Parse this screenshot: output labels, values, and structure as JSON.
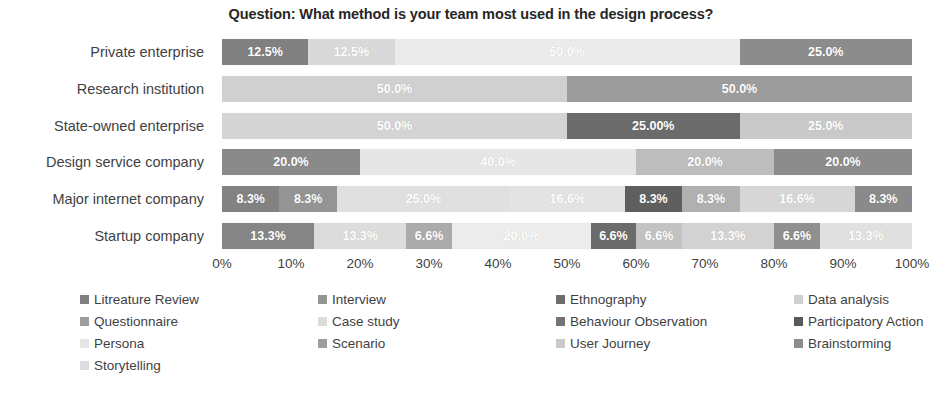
{
  "chart_data": {
    "type": "bar",
    "subtype": "horizontal-stacked-percent",
    "title": "Question: What method is your team most used in the design process?",
    "xlabel": "",
    "ylabel": "",
    "xlim": [
      0,
      100
    ],
    "grid": false,
    "legend_position": "bottom",
    "categories": [
      "Private enterprise",
      "Research institution",
      "State-owned enterprise",
      "Design service company",
      "Major internet company",
      "Startup company"
    ],
    "xticks": [
      "0%",
      "10%",
      "20%",
      "30%",
      "40%",
      "50%",
      "60%",
      "70%",
      "80%",
      "90%",
      "100%"
    ],
    "xtick_values": [
      0,
      10,
      20,
      30,
      40,
      50,
      60,
      70,
      80,
      90,
      100
    ],
    "series": [
      {
        "name": "Litreature Review",
        "color": "#808080",
        "values": [
          12.5,
          0,
          0,
          20.0,
          8.3,
          13.3
        ]
      },
      {
        "name": "Interview",
        "color": "#999999",
        "values": [
          0,
          0,
          0,
          0,
          8.3,
          0
        ]
      },
      {
        "name": "Ethnography",
        "color": "#6e6e6e",
        "values": [
          0,
          0,
          0,
          0,
          0,
          0
        ]
      },
      {
        "name": "Data analysis",
        "color": "#d9d9d9",
        "values": [
          12.5,
          0,
          0,
          0,
          0,
          13.3
        ]
      },
      {
        "name": "Questionnaire",
        "color": "#a6a6a6",
        "values": [
          0,
          50.0,
          0,
          0,
          0,
          6.6
        ]
      },
      {
        "name": "Case study",
        "color": "#e0e0e0",
        "values": [
          0,
          0,
          50.0,
          0,
          25.0,
          0
        ]
      },
      {
        "name": "Behaviour Observation",
        "color": "#737373",
        "values": [
          0,
          0,
          0,
          0,
          0,
          0
        ]
      },
      {
        "name": "Participatory Action",
        "color": "#595959",
        "values": [
          0,
          0,
          25.0,
          0,
          8.3,
          6.6
        ]
      },
      {
        "name": "Persona",
        "color": "#ebebeb",
        "values": [
          50.0,
          0,
          0,
          40.0,
          16.6,
          20.0
        ]
      },
      {
        "name": "Scenario",
        "color": "#9e9e9e",
        "values": [
          0,
          0,
          0,
          0,
          8.3,
          6.6
        ]
      },
      {
        "name": "User Journey",
        "color": "#c9c9c9",
        "values": [
          0,
          0,
          25.0,
          20.0,
          16.6,
          13.3
        ]
      },
      {
        "name": "Brainstorming",
        "color": "#8c8c8c",
        "values": [
          25.0,
          50.0,
          0,
          20.0,
          8.3,
          6.6
        ]
      },
      {
        "name": "Storytelling",
        "color": "#dedede",
        "values": [
          0,
          0,
          0,
          0,
          0,
          13.3
        ]
      }
    ],
    "bars": [
      {
        "category": "Private enterprise",
        "segments": [
          {
            "label": "12.5%",
            "value": 12.5,
            "series": "Litreature Review",
            "color": "#808080"
          },
          {
            "label": "12.5%",
            "value": 12.5,
            "series": "Data analysis",
            "color": "#d9d9d9"
          },
          {
            "label": "50.0%",
            "value": 50.0,
            "series": "Persona",
            "color": "#ebebeb"
          },
          {
            "label": "25.0%",
            "value": 25.0,
            "series": "Brainstorming",
            "color": "#8c8c8c"
          }
        ]
      },
      {
        "category": "Research institution",
        "segments": [
          {
            "label": "50.0%",
            "value": 50.0,
            "series": "Questionnaire",
            "color": "#d0d0d0"
          },
          {
            "label": "50.0%",
            "value": 50.0,
            "series": "Brainstorming",
            "color": "#9c9c9c"
          }
        ]
      },
      {
        "category": "State-owned enterprise",
        "segments": [
          {
            "label": "50.0%",
            "value": 50.0,
            "series": "Case study",
            "color": "#d4d4d4"
          },
          {
            "label": "25.00%",
            "value": 25.0,
            "series": "Participatory Action",
            "color": "#6b6b6b"
          },
          {
            "label": "25.0%",
            "value": 25.0,
            "series": "User Journey",
            "color": "#c9c9c9"
          }
        ]
      },
      {
        "category": "Design service company",
        "segments": [
          {
            "label": "20.0%",
            "value": 20.0,
            "series": "Litreature Review",
            "color": "#8a8a8a"
          },
          {
            "label": "40.0%",
            "value": 40.0,
            "series": "Persona",
            "color": "#e6e6e6"
          },
          {
            "label": "20.0%",
            "value": 20.0,
            "series": "User Journey",
            "color": "#bdbdbd"
          },
          {
            "label": "20.0%",
            "value": 20.0,
            "series": "Brainstorming",
            "color": "#8c8c8c"
          }
        ]
      },
      {
        "category": "Major internet company",
        "segments": [
          {
            "label": "8.3%",
            "value": 8.3,
            "series": "Litreature Review",
            "color": "#828282"
          },
          {
            "label": "8.3%",
            "value": 8.3,
            "series": "Interview",
            "color": "#949494"
          },
          {
            "label": "25.0%",
            "value": 25.0,
            "series": "Case study",
            "color": "#e0e0e0"
          },
          {
            "label": "16.6%",
            "value": 16.6,
            "series": "Persona",
            "color": "#e3e3e3"
          },
          {
            "label": "8.3%",
            "value": 8.3,
            "series": "Participatory Action",
            "color": "#5f5f5f"
          },
          {
            "label": "8.3%",
            "value": 8.3,
            "series": "Scenario",
            "color": "#b0b0b0"
          },
          {
            "label": "16.6%",
            "value": 16.6,
            "series": "User Journey",
            "color": "#d6d6d6"
          },
          {
            "label": "8.3%",
            "value": 8.3,
            "series": "Brainstorming",
            "color": "#8a8a8a"
          }
        ]
      },
      {
        "category": "Startup company",
        "segments": [
          {
            "label": "13.3%",
            "value": 13.3,
            "series": "Litreature Review",
            "color": "#858585"
          },
          {
            "label": "13.3%",
            "value": 13.3,
            "series": "Data analysis",
            "color": "#dcdcdc"
          },
          {
            "label": "6.6%",
            "value": 6.6,
            "series": "Questionnaire",
            "color": "#ababab"
          },
          {
            "label": "20.0%",
            "value": 20.0,
            "series": "Persona",
            "color": "#ececec"
          },
          {
            "label": "6.6%",
            "value": 6.6,
            "series": "Participatory Action",
            "color": "#6b6b6b"
          },
          {
            "label": "6.6%",
            "value": 6.6,
            "series": "Scenario",
            "color": "#c2c2c2"
          },
          {
            "label": "13.3%",
            "value": 13.3,
            "series": "User Journey",
            "color": "#d2d2d2"
          },
          {
            "label": "6.6%",
            "value": 6.6,
            "series": "Brainstorming",
            "color": "#8f8f8f"
          },
          {
            "label": "13.3%",
            "value": 13.3,
            "series": "Storytelling",
            "color": "#e0e0e0"
          }
        ]
      }
    ],
    "legend": [
      {
        "label": "Litreature Review",
        "color": "#808080"
      },
      {
        "label": "Interview",
        "color": "#949494"
      },
      {
        "label": "Ethnography",
        "color": "#6e6e6e"
      },
      {
        "label": "Data analysis",
        "color": "#cfcfcf"
      },
      {
        "label": "Questionnaire",
        "color": "#9e9e9e"
      },
      {
        "label": "Case study",
        "color": "#dcdcdc"
      },
      {
        "label": "Behaviour Observation",
        "color": "#737373"
      },
      {
        "label": "Participatory Action",
        "color": "#595959"
      },
      {
        "label": "Persona",
        "color": "#e6e6e6"
      },
      {
        "label": "Scenario",
        "color": "#9e9e9e"
      },
      {
        "label": "User Journey",
        "color": "#c9c9c9"
      },
      {
        "label": "Brainstorming",
        "color": "#8c8c8c"
      },
      {
        "label": "Storytelling",
        "color": "#dedede"
      }
    ]
  }
}
